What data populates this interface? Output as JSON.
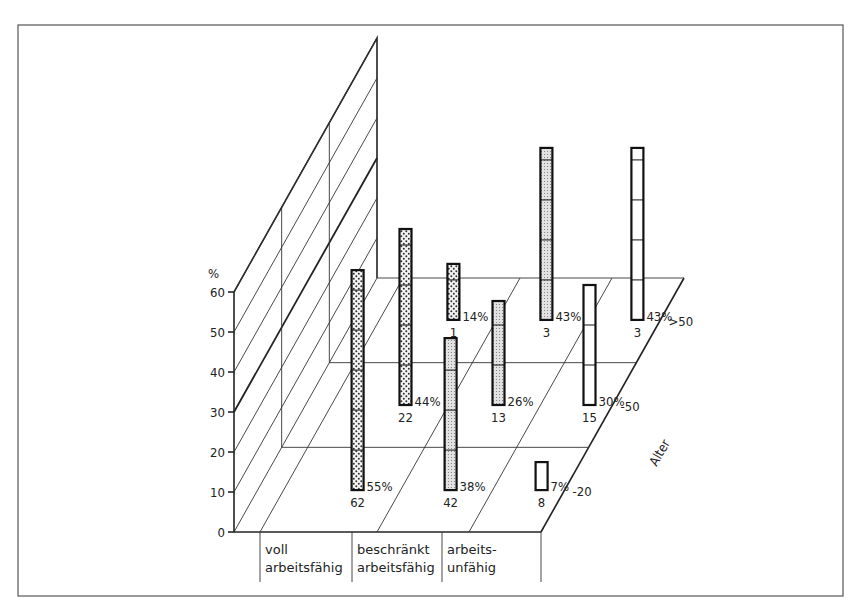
{
  "chart_data": {
    "type": "bar",
    "subtype": "3d-grouped-bar",
    "title": "",
    "ylabel": "%",
    "yticks": [
      "0",
      "10",
      "20",
      "30",
      "40",
      "50",
      "60"
    ],
    "ylim": [
      0,
      60
    ],
    "xlabel": "",
    "zlabel": "Alter",
    "categories": [
      {
        "line1": "voll",
        "line2": "arbeitsfähig"
      },
      {
        "line1": "beschränkt",
        "line2": "arbeitsfähig"
      },
      {
        "line1": "arbeits-",
        "line2": "unfähig"
      }
    ],
    "age_groups": [
      "-20",
      "-50",
      ">50"
    ],
    "series": [
      {
        "name": "-20",
        "values": [
          55,
          38,
          7
        ],
        "counts": [
          "62",
          "42",
          "8"
        ],
        "labels": [
          "55%",
          "38%",
          "7%"
        ]
      },
      {
        "name": "-50",
        "values": [
          44,
          26,
          30
        ],
        "counts": [
          "22",
          "13",
          "15"
        ],
        "labels": [
          "44%",
          "26%",
          "30%"
        ]
      },
      {
        "name": ">50",
        "values": [
          14,
          43,
          43
        ],
        "counts": [
          "1",
          "3",
          "3"
        ],
        "labels": [
          "14%",
          "43%",
          "43%"
        ]
      }
    ],
    "fills": [
      "dotted",
      "fine-stipple",
      "blank"
    ],
    "grid": true,
    "legend": "none"
  }
}
